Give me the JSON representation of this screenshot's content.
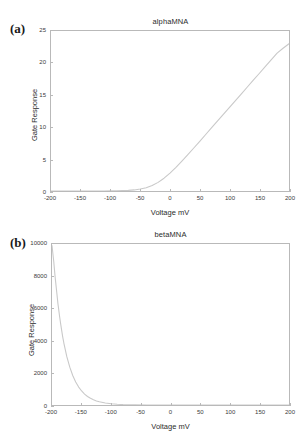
{
  "figure": {
    "background": "#ffffff",
    "curve_color": "#c9c9c9",
    "axis_color": "#b9b9b9",
    "text_color": "#2b2b2b"
  },
  "panels": [
    {
      "label": "(a)",
      "title": "alphaMNA",
      "xlabel": "Voltage mV",
      "ylabel": "Gate Response",
      "xticks": [
        "-200",
        "-150",
        "-100",
        "-50",
        "0",
        "50",
        "100",
        "150",
        "200"
      ],
      "yticks": [
        "0",
        "5",
        "10",
        "15",
        "20",
        "25"
      ]
    },
    {
      "label": "(b)",
      "title": "betaMNA",
      "xlabel": "Voltage mV",
      "ylabel": "Gate Response",
      "xticks": [
        "-200",
        "-150",
        "-100",
        "-50",
        "0",
        "50",
        "100",
        "150",
        "200"
      ],
      "yticks": [
        "0",
        "2000",
        "4000",
        "6000",
        "8000",
        "10000"
      ]
    }
  ],
  "chart_data": [
    {
      "type": "line",
      "title": "alphaMNA",
      "xlabel": "Voltage mV",
      "ylabel": "Gate Response",
      "xlim": [
        -200,
        200
      ],
      "ylim": [
        0,
        25
      ],
      "xticks": [
        -200,
        -150,
        -100,
        -50,
        0,
        50,
        100,
        150,
        200
      ],
      "yticks": [
        0,
        5,
        10,
        15,
        20,
        25
      ],
      "grid": false,
      "legend": "none",
      "series": [
        {
          "name": "alphaMNA",
          "color": "#c9c9c9",
          "x": [
            -200,
            -190,
            -180,
            -170,
            -160,
            -150,
            -140,
            -130,
            -120,
            -110,
            -100,
            -90,
            -80,
            -70,
            -60,
            -50,
            -40,
            -30,
            -20,
            -10,
            0,
            10,
            20,
            30,
            40,
            50,
            60,
            70,
            80,
            90,
            100,
            110,
            120,
            130,
            140,
            150,
            160,
            170,
            180,
            190,
            200
          ],
          "y": [
            0.0,
            0.0,
            0.0,
            0.0,
            0.0,
            0.0,
            0.0,
            0.0,
            0.01,
            0.01,
            0.02,
            0.03,
            0.06,
            0.1,
            0.17,
            0.3,
            0.52,
            0.86,
            1.35,
            2.0,
            2.8,
            3.7,
            4.67,
            5.68,
            6.72,
            7.77,
            8.83,
            9.89,
            10.95,
            12.01,
            13.07,
            14.13,
            15.19,
            16.25,
            17.31,
            18.36,
            19.42,
            20.48,
            21.54,
            22.3,
            23.0
          ]
        }
      ]
    },
    {
      "type": "line",
      "title": "betaMNA",
      "xlabel": "Voltage mV",
      "ylabel": "Gate Response",
      "xlim": [
        -200,
        200
      ],
      "ylim": [
        0,
        10000
      ],
      "xticks": [
        -200,
        -150,
        -100,
        -50,
        0,
        50,
        100,
        150,
        200
      ],
      "yticks": [
        0,
        2000,
        4000,
        6000,
        8000,
        10000
      ],
      "grid": false,
      "legend": "none",
      "series": [
        {
          "name": "betaMNA",
          "color": "#c9c9c9",
          "x": [
            -200,
            -197,
            -195,
            -192,
            -190,
            -187,
            -185,
            -182,
            -180,
            -175,
            -170,
            -165,
            -160,
            -155,
            -150,
            -145,
            -140,
            -135,
            -130,
            -125,
            -120,
            -110,
            -100,
            -90,
            -80,
            -60,
            -40,
            -20,
            0,
            50,
            100,
            150,
            200
          ],
          "y": [
            9900,
            8900,
            8050,
            7000,
            6300,
            5450,
            4950,
            4250,
            3850,
            3000,
            2350,
            1830,
            1430,
            1115,
            870,
            680,
            530,
            415,
            323,
            252,
            197,
            120,
            73,
            45,
            27,
            10,
            4,
            1.5,
            0.6,
            0.1,
            0.0,
            0.0,
            0.0
          ]
        }
      ]
    }
  ]
}
